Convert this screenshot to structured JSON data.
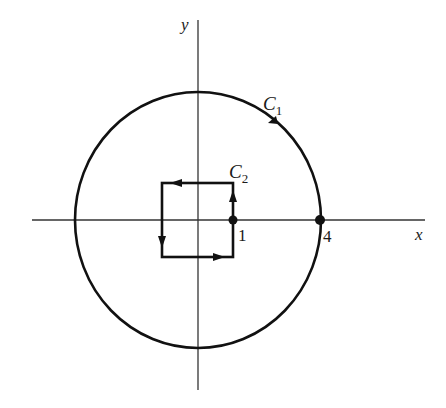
{
  "figure": {
    "axes": {
      "x_label": "x",
      "y_label": "y"
    },
    "curves": [
      {
        "name": "C",
        "subscript": "1",
        "shape": "circle",
        "orientation": "counterclockwise",
        "radius": 4
      },
      {
        "name": "C",
        "subscript": "2",
        "shape": "square",
        "orientation": "counterclockwise",
        "right_edge_x": 1
      }
    ],
    "points": [
      {
        "label": "1",
        "x": 1,
        "y": 0
      },
      {
        "label": "4",
        "x": 4,
        "y": 0
      }
    ],
    "colors": {
      "stroke": "#111111",
      "axis": "#333333",
      "background": "#ffffff"
    }
  }
}
